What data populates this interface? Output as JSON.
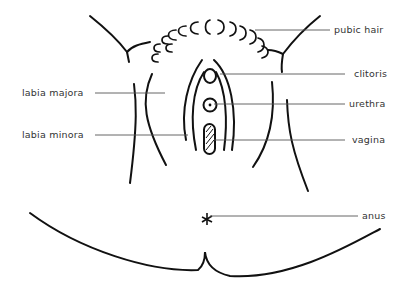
{
  "diagram": {
    "type": "anatomical line drawing",
    "labels": {
      "pubic_hair": "pubic hair",
      "clitoris": "clitoris",
      "labia_majora": "labia majora",
      "urethra": "urethra",
      "labia_minora": "labia minora",
      "vagina": "vagina",
      "anus": "anus"
    },
    "colors": {
      "line": "#111111",
      "leader": "#555555",
      "text": "#333333",
      "background": "#ffffff"
    }
  }
}
